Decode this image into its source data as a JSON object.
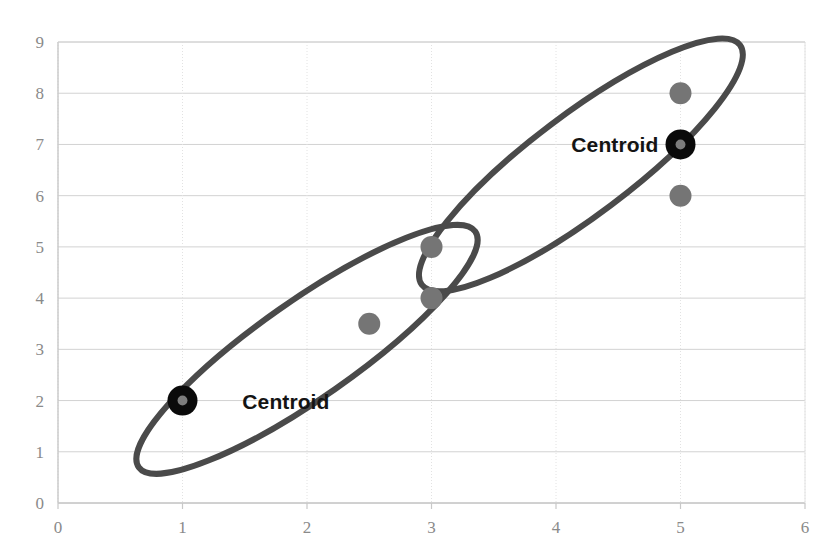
{
  "chart_data": {
    "type": "scatter",
    "title": "",
    "subtitle": "",
    "xlabel": "",
    "ylabel": "",
    "xlim": [
      0,
      6
    ],
    "ylim": [
      0,
      9
    ],
    "xticks": [
      "0",
      "1",
      "2",
      "3",
      "4",
      "5",
      "6"
    ],
    "yticks": [
      "0",
      "1",
      "2",
      "3",
      "4",
      "5",
      "6",
      "7",
      "8",
      "9"
    ],
    "xtick_values": [
      0,
      1,
      2,
      3,
      4,
      5,
      6
    ],
    "ytick_values": [
      0,
      1,
      2,
      3,
      4,
      5,
      6,
      7,
      8,
      9
    ],
    "grid": true,
    "legend": "none",
    "series": [
      {
        "name": "data-points",
        "marker": "filled-circle",
        "color": "#757575",
        "radius_px": 11,
        "points": [
          {
            "x": 1,
            "y": 2
          },
          {
            "x": 2.5,
            "y": 3.5
          },
          {
            "x": 3,
            "y": 4
          },
          {
            "x": 3,
            "y": 5
          },
          {
            "x": 5,
            "y": 6
          },
          {
            "x": 5,
            "y": 8
          }
        ]
      },
      {
        "name": "centroids",
        "marker": "ring",
        "color": "#0a0a0a",
        "inner_color": "#7d7d7d",
        "radius_px": 15,
        "points": [
          {
            "x": 1,
            "y": 2
          },
          {
            "x": 5,
            "y": 7
          }
        ]
      }
    ],
    "clusters": [
      {
        "name": "lower-cluster",
        "center": {
          "x": 2.0,
          "y": 3.0
        },
        "rx_data": 1.65,
        "ry_data": 0.95,
        "rotation_deg": -35,
        "stroke": "#4a4a4a",
        "stroke_width_px": 6,
        "members": [
          {
            "x": 1,
            "y": 2
          },
          {
            "x": 2.5,
            "y": 3.5
          },
          {
            "x": 3,
            "y": 4
          }
        ],
        "centroid": {
          "x": 1,
          "y": 2
        }
      },
      {
        "name": "upper-cluster",
        "center": {
          "x": 4.2,
          "y": 6.6
        },
        "rx_data": 1.6,
        "ry_data": 0.98,
        "rotation_deg": -37,
        "stroke": "#4a4a4a",
        "stroke_width_px": 6,
        "members": [
          {
            "x": 3,
            "y": 5
          },
          {
            "x": 5,
            "y": 6
          },
          {
            "x": 5,
            "y": 8
          }
        ],
        "centroid": {
          "x": 5,
          "y": 7
        }
      }
    ],
    "annotations": [
      {
        "text": "Centroid",
        "x": 1,
        "y": 2,
        "anchor": "right-of-point",
        "cluster": "lower-cluster"
      },
      {
        "text": "Centroid",
        "x": 5,
        "y": 7,
        "anchor": "left-of-point",
        "cluster": "upper-cluster"
      }
    ],
    "colors": {
      "background": "#ffffff",
      "grid_major": "#d2d2d2",
      "grid_minor": "#e2e2e2",
      "axis_line": "#c8c8c8",
      "tick_text": "#8a8a8a",
      "point": "#757575",
      "centroid_ring": "#0a0a0a",
      "centroid_core": "#7d7d7d",
      "ellipse": "#4a4a4a",
      "label_text": "#141414"
    }
  },
  "labels": {
    "centroid_lower": "Centroid",
    "centroid_upper": "Centroid"
  }
}
